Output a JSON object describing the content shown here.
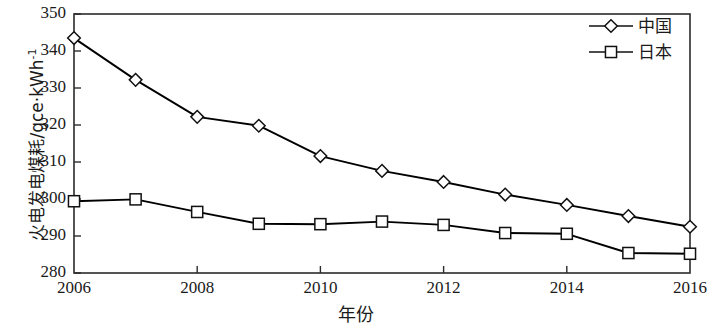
{
  "chart_data": {
    "type": "line",
    "title": "",
    "xlabel": "年份",
    "ylabel": "火电发电煤耗/gce·kWh",
    "ylabel_superscript": "-1",
    "x": [
      2006,
      2007,
      2008,
      2009,
      2010,
      2011,
      2012,
      2013,
      2014,
      2015,
      2016
    ],
    "xlim": [
      2006,
      2016
    ],
    "ylim": [
      280,
      350
    ],
    "xticks": [
      2006,
      2008,
      2010,
      2012,
      2014,
      2016
    ],
    "xtick_labels": [
      "2006",
      "2008",
      "2010",
      "2012",
      "2014",
      "2016"
    ],
    "yticks": [
      280,
      290,
      300,
      310,
      320,
      330,
      340,
      350
    ],
    "ytick_labels": [
      "280",
      "290",
      "300",
      "310",
      "320",
      "330",
      "340",
      "350"
    ],
    "grid": false,
    "legend_position": "top-right",
    "series": [
      {
        "name": "中国",
        "marker": "diamond",
        "color": "#000000",
        "values": [
          343.5,
          332.2,
          322.2,
          319.8,
          311.6,
          307.6,
          304.6,
          301.2,
          298.4,
          295.4,
          292.5
        ]
      },
      {
        "name": "日本",
        "marker": "square",
        "color": "#000000",
        "values": [
          299.4,
          299.9,
          296.5,
          293.3,
          293.2,
          293.9,
          293.0,
          290.8,
          290.6,
          285.4,
          285.2
        ]
      }
    ]
  },
  "legend": {
    "entries": [
      {
        "label": "中国",
        "marker": "diamond"
      },
      {
        "label": "日本",
        "marker": "square"
      }
    ]
  }
}
